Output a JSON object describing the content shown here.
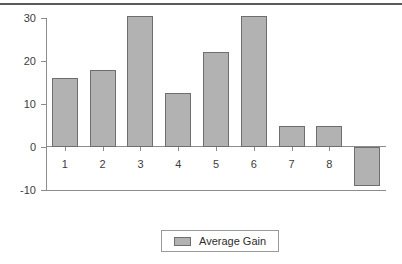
{
  "chart_data": {
    "type": "bar",
    "title": "",
    "xlabel": "",
    "ylabel": "",
    "categories": [
      "1",
      "2",
      "3",
      "4",
      "5",
      "6",
      "7",
      "8",
      "9"
    ],
    "values": [
      16,
      18,
      30.5,
      12.5,
      22,
      30.5,
      5,
      5,
      -9
    ],
    "series": [
      {
        "name": "Average Gain",
        "values": [
          16,
          18,
          30.5,
          12.5,
          22,
          30.5,
          5,
          5,
          -9
        ],
        "color": "#b2b2b2",
        "border_color": "#6e6e6e"
      }
    ],
    "ylim": [
      -10,
      30
    ],
    "yticks": [
      30,
      20,
      10,
      0,
      -10
    ],
    "ytick_labels": [
      "30",
      "20",
      "10",
      "0",
      "-10"
    ],
    "xtick_labels": [
      "1",
      "2",
      "3",
      "4",
      "5",
      "6",
      "7",
      "8",
      "9"
    ],
    "grid": false,
    "legend": {
      "position": "bottom-center",
      "entries": [
        {
          "label": "Average Gain",
          "swatch": "#b2b2b2"
        }
      ]
    },
    "axis_color": "#8c8c8c",
    "text_color": "#3d3d3d",
    "background": "#ffffff",
    "top_rule_color": "#5a5a5a"
  }
}
